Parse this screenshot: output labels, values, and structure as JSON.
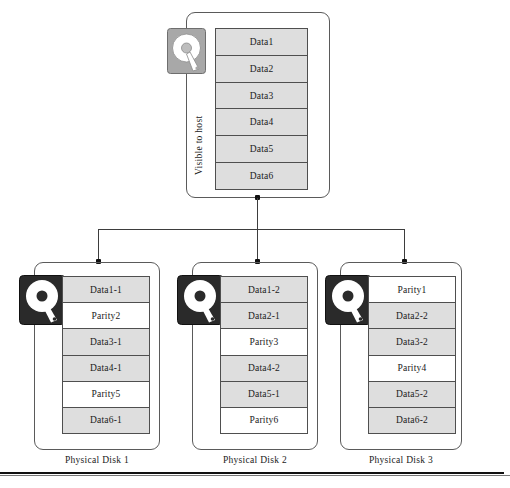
{
  "diagram": {
    "colors": {
      "data_cell_fill": "#dedede",
      "parity_cell_fill": "#ffffff",
      "cell_border": "#4f4f4f",
      "group_border": "#5a5a5a",
      "connector": "#3d3d3d",
      "node_dot": "#111111",
      "host_icon_body": "#a8a8a8",
      "physical_icon_body": "#2a2a2a"
    }
  },
  "host": {
    "label": "Visible to host",
    "icon": "hard-disk-icon",
    "cells": [
      {
        "label": "Data1",
        "kind": "data"
      },
      {
        "label": "Data2",
        "kind": "data"
      },
      {
        "label": "Data3",
        "kind": "data"
      },
      {
        "label": "Data4",
        "kind": "data"
      },
      {
        "label": "Data5",
        "kind": "data"
      },
      {
        "label": "Data6",
        "kind": "data"
      }
    ]
  },
  "physical_disks": [
    {
      "label": "Physical Disk 1",
      "icon": "hard-disk-icon",
      "cells": [
        {
          "label": "Data1-1",
          "kind": "data"
        },
        {
          "label": "Parity2",
          "kind": "parity"
        },
        {
          "label": "Data3-1",
          "kind": "data"
        },
        {
          "label": "Data4-1",
          "kind": "data"
        },
        {
          "label": "Parity5",
          "kind": "parity"
        },
        {
          "label": "Data6-1",
          "kind": "data"
        }
      ]
    },
    {
      "label": "Physical Disk 2",
      "icon": "hard-disk-icon",
      "cells": [
        {
          "label": "Data1-2",
          "kind": "data"
        },
        {
          "label": "Data2-1",
          "kind": "data"
        },
        {
          "label": "Parity3",
          "kind": "parity"
        },
        {
          "label": "Data4-2",
          "kind": "data"
        },
        {
          "label": "Data5-1",
          "kind": "data"
        },
        {
          "label": "Parity6",
          "kind": "parity"
        }
      ]
    },
    {
      "label": "Physical Disk 3",
      "icon": "hard-disk-icon",
      "cells": [
        {
          "label": "Parity1",
          "kind": "parity"
        },
        {
          "label": "Data2-2",
          "kind": "data"
        },
        {
          "label": "Data3-2",
          "kind": "data"
        },
        {
          "label": "Parity4",
          "kind": "parity"
        },
        {
          "label": "Data5-2",
          "kind": "data"
        },
        {
          "label": "Data6-2",
          "kind": "data"
        }
      ]
    }
  ]
}
